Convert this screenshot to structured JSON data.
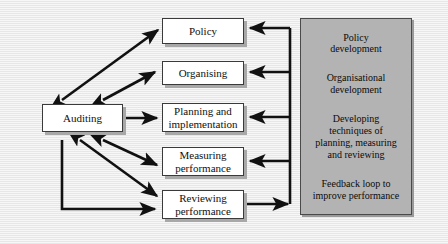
{
  "diagram": {
    "background_color": "#ededed",
    "panel_color": "#b3b3b3",
    "node_fill": "#ffffff",
    "line_color": "#111111"
  },
  "nodes": [
    {
      "id": "policy",
      "label": "Policy"
    },
    {
      "id": "organising",
      "label": "Organising"
    },
    {
      "id": "planning",
      "label": "Planning and\nimplementation"
    },
    {
      "id": "measuring",
      "label": "Measuring\nperformance"
    },
    {
      "id": "reviewing",
      "label": "Reviewing\nperformance"
    },
    {
      "id": "auditing",
      "label": "Auditing"
    }
  ],
  "panel": {
    "lines": [
      "Policy\ndevelopment",
      "Organisational\ndevelopment",
      "Developing\ntechniques of\nplanning, measuring\nand reviewing",
      "Feedback loop to\nimprove performance"
    ]
  },
  "connections": [
    {
      "id": "auditing-policy",
      "from": "Auditing",
      "to": "Policy",
      "style": "double-arrow"
    },
    {
      "id": "auditing-organising",
      "from": "Auditing",
      "to": "Organising",
      "style": "double-arrow"
    },
    {
      "id": "auditing-planning",
      "from": "Auditing",
      "to": "Planning and implementation",
      "style": "double-arrow"
    },
    {
      "id": "auditing-measuring",
      "from": "Auditing",
      "to": "Measuring performance",
      "style": "double-arrow"
    },
    {
      "id": "auditing-reviewing",
      "from": "Auditing",
      "to": "Reviewing performance",
      "style": "double-arrow"
    },
    {
      "id": "auditing-reviewing-bus",
      "from": "Auditing",
      "to": "Reviewing performance",
      "style": "single-arrow"
    },
    {
      "id": "reviewing-bus",
      "from": "Reviewing performance",
      "to": "Feedback bus",
      "style": "single-arrow"
    },
    {
      "id": "bus-policy",
      "from": "Feedback bus",
      "to": "Policy",
      "style": "single-arrow"
    },
    {
      "id": "bus-organising",
      "from": "Feedback bus",
      "to": "Organising",
      "style": "single-arrow"
    },
    {
      "id": "bus-planning",
      "from": "Feedback bus",
      "to": "Planning and implementation",
      "style": "single-arrow"
    },
    {
      "id": "bus-measuring",
      "from": "Feedback bus",
      "to": "Measuring performance",
      "style": "single-arrow"
    }
  ]
}
